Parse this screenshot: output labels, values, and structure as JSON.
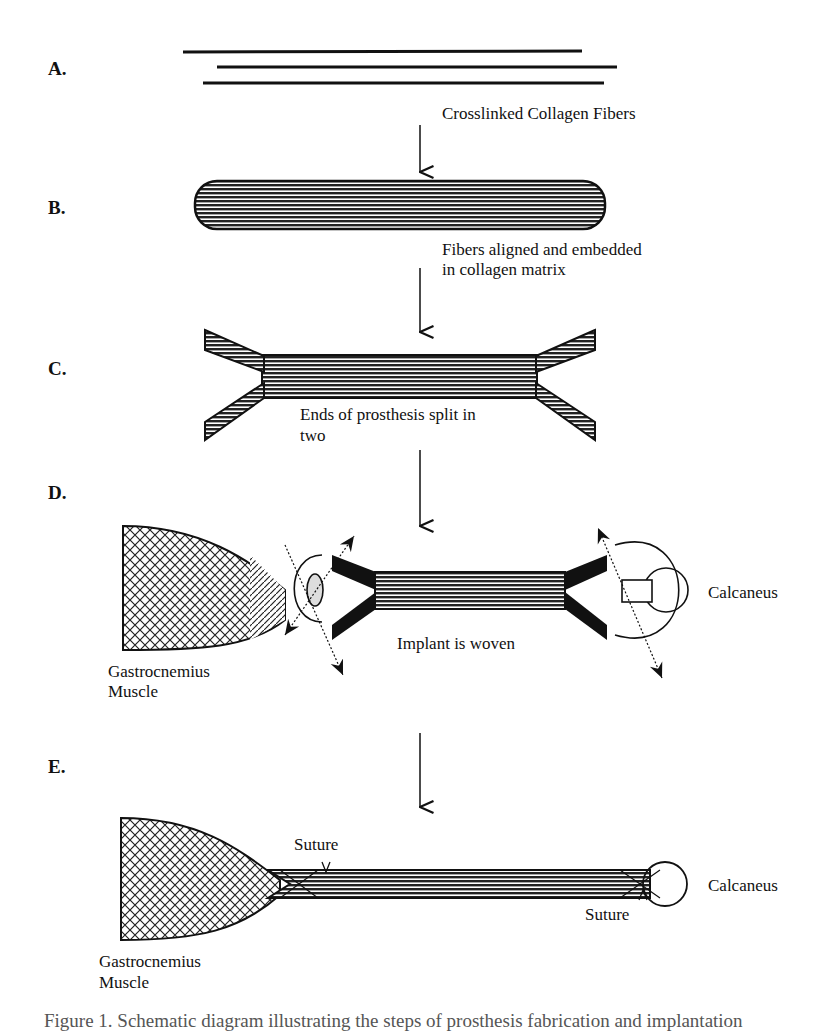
{
  "steps": {
    "A": {
      "label": "A.",
      "caption": "Crosslinked Collagen Fibers"
    },
    "B": {
      "label": "B.",
      "caption_line1": "Fibers aligned and embedded",
      "caption_line2": "in collagen matrix"
    },
    "C": {
      "label": "C.",
      "caption_line1": "Ends of prosthesis split in",
      "caption_line2": "two"
    },
    "D": {
      "label": "D.",
      "caption": "Implant is woven",
      "left_label_line1": "Gastrocnemius",
      "left_label_line2": "Muscle",
      "right_label": "Calcaneus"
    },
    "E": {
      "label": "E.",
      "suture_top": "Suture",
      "suture_bottom": "Suture",
      "left_label_line1": "Gastrocnemius",
      "left_label_line2": "Muscle",
      "right_label": "Calcaneus"
    }
  },
  "figure_caption": "Figure 1. Schematic diagram illustrating the steps of prosthesis fabrication and implantation"
}
